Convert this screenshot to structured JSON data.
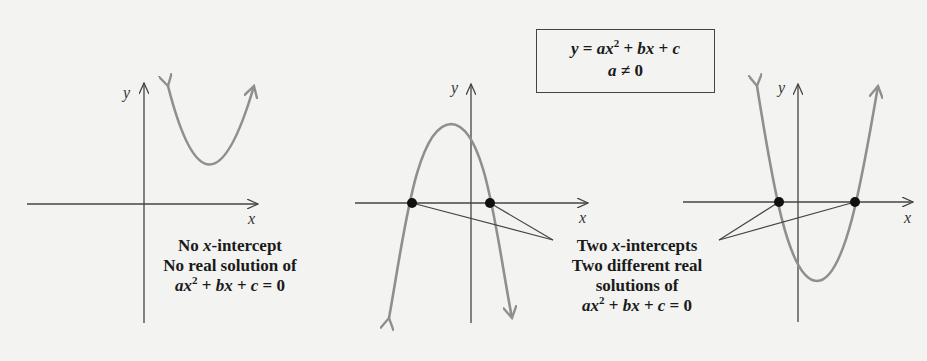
{
  "formula_box": {
    "line1_parts": [
      "y",
      " = ",
      "ax",
      "2",
      " + ",
      "bx",
      " + ",
      "c"
    ],
    "line2_parts": [
      "a",
      " ≠ 0"
    ]
  },
  "graphs": [
    {
      "id": "no-intercept",
      "axis_labels": {
        "x": "x",
        "y": "y"
      },
      "caption": {
        "line1_pre": "No ",
        "line1_var": "x",
        "line1_post": "-intercept",
        "line2": "No real solution of",
        "equation": {
          "a": "ax",
          "exp": "2",
          "rest1": " + ",
          "b": "bx",
          "rest2": " + ",
          "c": "c",
          "rest3": " = 0"
        }
      }
    },
    {
      "id": "two-intercepts-down",
      "axis_labels": {
        "x": "x",
        "y": "y"
      }
    },
    {
      "id": "two-intercepts-up",
      "axis_labels": {
        "x": "x",
        "y": "y"
      }
    }
  ],
  "shared_caption": {
    "line1_pre": "Two ",
    "line1_var": "x",
    "line1_post": "-intercepts",
    "line2": "Two different real",
    "line3": "solutions of",
    "equation": {
      "a": "ax",
      "exp": "2",
      "rest1": " + ",
      "b": "bx",
      "rest2": " + ",
      "c": "c",
      "rest3": " = 0"
    }
  },
  "colors": {
    "curve": "#8f8f8f",
    "axis": "#444444",
    "point": "#111111",
    "background": "#f3f3f1"
  }
}
